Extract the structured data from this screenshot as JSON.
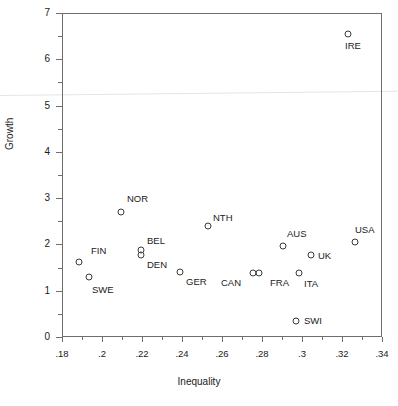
{
  "chart_data": {
    "type": "scatter",
    "title": "",
    "xlabel": "Inequality",
    "ylabel": "Growth",
    "xlim": [
      0.18,
      0.34
    ],
    "ylim": [
      0,
      7
    ],
    "grid": false,
    "legend": "none",
    "x_ticks": [
      {
        "value": 0.18,
        "label": ".18",
        "major": true
      },
      {
        "value": 0.19,
        "label": "",
        "major": false
      },
      {
        "value": 0.2,
        "label": ".2",
        "major": true
      },
      {
        "value": 0.21,
        "label": "",
        "major": false
      },
      {
        "value": 0.22,
        "label": ".22",
        "major": true
      },
      {
        "value": 0.23,
        "label": "",
        "major": false
      },
      {
        "value": 0.24,
        "label": ".24",
        "major": true
      },
      {
        "value": 0.25,
        "label": "",
        "major": false
      },
      {
        "value": 0.26,
        "label": ".26",
        "major": true
      },
      {
        "value": 0.27,
        "label": "",
        "major": false
      },
      {
        "value": 0.28,
        "label": ".28",
        "major": true
      },
      {
        "value": 0.29,
        "label": "",
        "major": false
      },
      {
        "value": 0.3,
        "label": ".3",
        "major": true
      },
      {
        "value": 0.31,
        "label": "",
        "major": false
      },
      {
        "value": 0.32,
        "label": ".32",
        "major": true
      },
      {
        "value": 0.33,
        "label": "",
        "major": false
      },
      {
        "value": 0.34,
        "label": ".34",
        "major": true
      }
    ],
    "y_ticks": [
      {
        "value": 0,
        "label": "0",
        "major": true
      },
      {
        "value": 0.5,
        "label": "",
        "major": false
      },
      {
        "value": 1,
        "label": "1",
        "major": true
      },
      {
        "value": 1.5,
        "label": "",
        "major": false
      },
      {
        "value": 2,
        "label": "2",
        "major": true
      },
      {
        "value": 2.5,
        "label": "",
        "major": false
      },
      {
        "value": 3,
        "label": "3",
        "major": true
      },
      {
        "value": 3.5,
        "label": "",
        "major": false
      },
      {
        "value": 4,
        "label": "4",
        "major": true
      },
      {
        "value": 4.5,
        "label": "",
        "major": false
      },
      {
        "value": 5,
        "label": "5",
        "major": true
      },
      {
        "value": 5.5,
        "label": "",
        "major": false
      },
      {
        "value": 6,
        "label": "6",
        "major": true
      },
      {
        "value": 6.5,
        "label": "",
        "major": false
      },
      {
        "value": 7,
        "label": "7",
        "major": true
      }
    ],
    "points": [
      {
        "label": "FIN",
        "x": 0.1885,
        "y": 1.62,
        "label_dx": 12,
        "label_dy": -16
      },
      {
        "label": "SWE",
        "x": 0.1935,
        "y": 1.3,
        "label_dx": 3,
        "label_dy": 8
      },
      {
        "label": "NOR",
        "x": 0.2095,
        "y": 2.7,
        "label_dx": 6,
        "label_dy": -18
      },
      {
        "label": "BEL",
        "x": 0.2195,
        "y": 1.88,
        "label_dx": 6,
        "label_dy": -14
      },
      {
        "label": "DEN",
        "x": 0.2195,
        "y": 1.78,
        "label_dx": 6,
        "label_dy": 5
      },
      {
        "label": "GER",
        "x": 0.239,
        "y": 1.4,
        "label_dx": 6,
        "label_dy": 5
      },
      {
        "label": "NTH",
        "x": 0.253,
        "y": 2.39,
        "label_dx": 5,
        "label_dy": -13
      },
      {
        "label": "CAN",
        "x": 0.2755,
        "y": 1.39,
        "label_dx": -32,
        "label_dy": 5
      },
      {
        "label": "FRA",
        "x": 0.2785,
        "y": 1.39,
        "label_dx": 11,
        "label_dy": 5
      },
      {
        "label": "AUS",
        "x": 0.2905,
        "y": 1.97,
        "label_dx": 4,
        "label_dy": -17
      },
      {
        "label": "ITA",
        "x": 0.2985,
        "y": 1.38,
        "label_dx": 5,
        "label_dy": 6
      },
      {
        "label": "SWI",
        "x": 0.297,
        "y": 0.35,
        "label_dx": 8,
        "label_dy": -5
      },
      {
        "label": "UK",
        "x": 0.3045,
        "y": 1.78,
        "label_dx": 7,
        "label_dy": -4
      },
      {
        "label": "USA",
        "x": 0.3265,
        "y": 2.05,
        "label_dx": 0,
        "label_dy": -17
      },
      {
        "label": "IRE",
        "x": 0.323,
        "y": 6.55,
        "label_dx": -3,
        "label_dy": 7
      }
    ]
  }
}
